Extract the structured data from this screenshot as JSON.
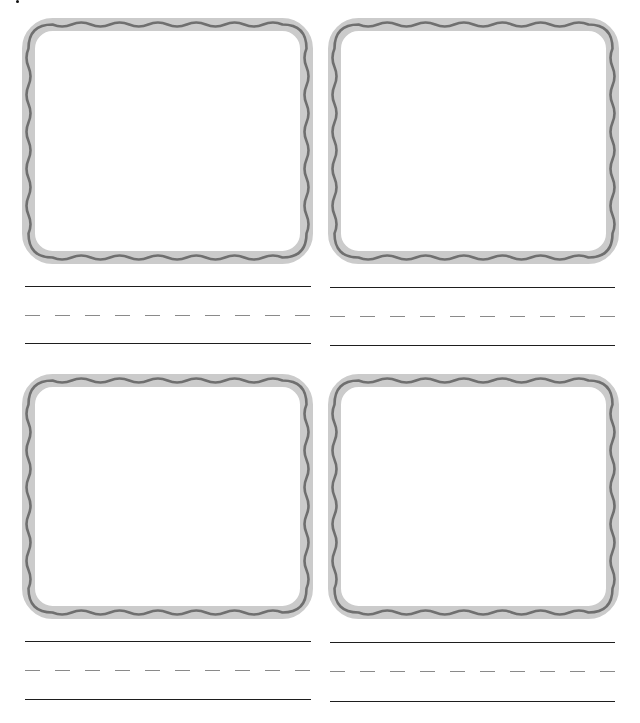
{
  "worksheet": {
    "type": "handwriting-picture-worksheet",
    "colors": {
      "frame_band": "#cbcbcb",
      "frame_wave": "#6f6f6f",
      "solid_line": "#1e1e1e",
      "dashed_line": "#8a8a8a",
      "background": "#ffffff"
    },
    "cards": [
      {
        "id": "top-left",
        "picture_box": "",
        "writing_text": ""
      },
      {
        "id": "top-right",
        "picture_box": "",
        "writing_text": ""
      },
      {
        "id": "bottom-left",
        "picture_box": "",
        "writing_text": ""
      },
      {
        "id": "bottom-right",
        "picture_box": "",
        "writing_text": ""
      }
    ]
  }
}
